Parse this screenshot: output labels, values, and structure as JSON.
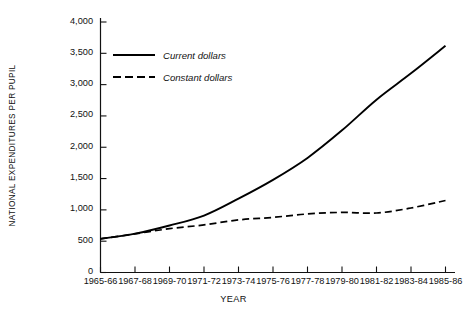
{
  "chart_data": {
    "type": "line",
    "title": "",
    "xlabel": "YEAR",
    "ylabel": "NATIONAL EXPENDITURES PER PUPIL",
    "categories": [
      "1965-66",
      "1967-68",
      "1969-70",
      "1971-72",
      "1973-74",
      "1975-76",
      "1977-78",
      "1979-80",
      "1981-82",
      "1983-84",
      "1985-86"
    ],
    "ylim": [
      0,
      4000
    ],
    "yticks": [
      0,
      500,
      1000,
      1500,
      2000,
      2500,
      3000,
      3500,
      4000
    ],
    "ytick_labels": [
      "0",
      "500",
      "1,000",
      "1,500",
      "2,000",
      "2,500",
      "3,000",
      "3,500",
      "4,000"
    ],
    "grid": false,
    "legend_position": "upper-left-inside",
    "series": [
      {
        "name": "Current dollars",
        "style": "solid",
        "color": "#000000",
        "values": [
          537,
          620,
          750,
          910,
          1180,
          1480,
          1830,
          2270,
          2760,
          3180,
          3620
        ]
      },
      {
        "name": "Constant dollars",
        "style": "dashed",
        "color": "#000000",
        "values": [
          537,
          617,
          700,
          760,
          840,
          880,
          935,
          960,
          950,
          1030,
          1150
        ]
      }
    ]
  },
  "legend": {
    "items": [
      {
        "label": "Current dollars",
        "style": "solid"
      },
      {
        "label": "Constant dollars",
        "style": "dashed"
      }
    ]
  },
  "axes": {
    "y_title": "NATIONAL EXPENDITURES PER PUPIL",
    "x_title": "YEAR"
  }
}
